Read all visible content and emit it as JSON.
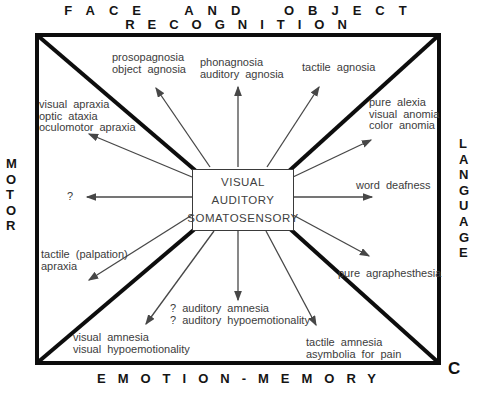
{
  "figure": {
    "top_edge_line1": "FACE AND OBJECT",
    "top_edge_line2": "RECOGNITION",
    "left_edge": "MOTOR",
    "right_edge": "LANGUAGE",
    "bottom_edge": "EMOTION-MEMORY",
    "panel_letter": "C"
  },
  "center_box": {
    "line1": "VISUAL",
    "line2": "AUDITORY",
    "line3": "SOMATOSENSORY"
  },
  "deficit_labels": {
    "prosopagnosia": "prosopagnosia\nobject agnosia",
    "phonagnosia": "phonagnosia\nauditory agnosia",
    "tactile_agnosia": "tactile agnosia",
    "visual_apraxia": "visual apraxia\noptic ataxia\noculomotor apraxia",
    "pure_alexia": "pure alexia\nvisual anomia\ncolor anomia",
    "unknown_motor": "?",
    "word_deafness": "word deafness",
    "tactile_palpation_apraxia": "tactile (palpation)\napraxia",
    "pure_agraphesthesia": "pure agraphesthesia",
    "visual_amnesia": "visual amnesia\nvisual hypoemotionality",
    "auditory_amnesia": "? auditory amnesia\n? auditory hypoemotionality",
    "tactile_amnesia": "tactile amnesia\nasymbolia for pain"
  },
  "colors": {
    "frame": "#0d0d0d",
    "arrow": "#474747",
    "label_text": "#3c3c3c",
    "background": "#ffffff"
  }
}
